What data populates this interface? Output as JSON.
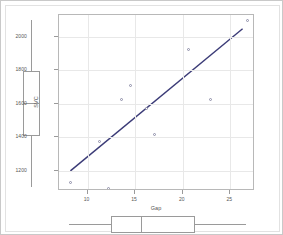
{
  "chart_data": {
    "type": "scatter",
    "title": "",
    "xlabel": "Gap",
    "ylabel": "SVC",
    "xlim": [
      7.0,
      27.6
    ],
    "ylim": [
      1080,
      2130
    ],
    "xticks": [
      10,
      15,
      20,
      25
    ],
    "yticks": [
      1200,
      1400,
      1600,
      1800,
      2000
    ],
    "xtick_labels": [
      "10",
      "15",
      "20",
      "25"
    ],
    "ytick_labels": [
      "1200",
      "1400",
      "1600",
      "1800",
      "2000"
    ],
    "grid": true,
    "legend": "none",
    "points": [
      {
        "x": 8.2,
        "y": 1130
      },
      {
        "x": 11.3,
        "y": 1378
      },
      {
        "x": 12.2,
        "y": 1098
      },
      {
        "x": 13.6,
        "y": 1625
      },
      {
        "x": 14.5,
        "y": 1712
      },
      {
        "x": 16.2,
        "y": 1572
      },
      {
        "x": 17.0,
        "y": 1418
      },
      {
        "x": 20.6,
        "y": 1922
      },
      {
        "x": 22.9,
        "y": 1628
      },
      {
        "x": 26.8,
        "y": 2095
      }
    ],
    "fit_line": {
      "label": "least-squares fit",
      "color": "#3b3b77",
      "x_start": 8.2,
      "y_start": 1200,
      "x_end": 26.3,
      "y_end": 2048
    },
    "marginal_boxplot_y": {
      "orientation": "vertical",
      "label": "SVC",
      "min": 1098,
      "q1": 1400,
      "median": 1600,
      "q3": 1790,
      "max": 2095
    },
    "marginal_boxplot_x": {
      "orientation": "horizontal",
      "label": "Gap",
      "min": 8.2,
      "q1": 12.6,
      "median": 15.7,
      "q3": 21.4,
      "max": 26.8
    }
  },
  "colors": {
    "point_edge": "#8e8ea8",
    "line": "#3b3b77",
    "grid": "#e8e8e8",
    "axis": "#9a9a9a",
    "frame": "#b8b8b8",
    "outer_border": "#c9c9c9",
    "background": "#ffffff"
  }
}
